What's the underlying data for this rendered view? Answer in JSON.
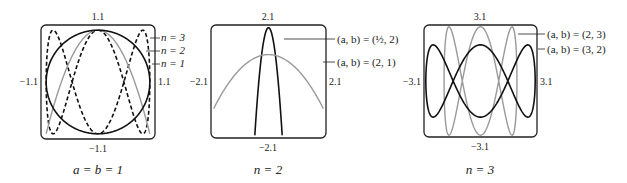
{
  "chart_data": [
    {
      "type": "line",
      "title": "a = b = 1",
      "caption": "a = b = 1",
      "equation": "x = a sin t, y = b cos(n t)",
      "xlim": [
        -1.1,
        1.1
      ],
      "ylim": [
        -1.1,
        1.1
      ],
      "tick_labels": {
        "top": "1.1",
        "bottom": "−1.1",
        "left": "−1.1",
        "right": "1.1"
      },
      "series": [
        {
          "name": "n = 3",
          "a": 1,
          "b": 1,
          "n": 3,
          "style": "dashed",
          "color": "#111111"
        },
        {
          "name": "n = 2",
          "a": 1,
          "b": 1,
          "n": 2,
          "style": "solid",
          "color": "#999999"
        },
        {
          "name": "n = 1",
          "a": 1,
          "b": 1,
          "n": 1,
          "style": "solid",
          "color": "#111111"
        }
      ],
      "legend": [
        "n = 3",
        "n = 2",
        "n = 1"
      ]
    },
    {
      "type": "line",
      "title": "n = 2",
      "caption": "n = 2",
      "xlim": [
        -2.1,
        2.1
      ],
      "ylim": [
        -2.1,
        2.1
      ],
      "tick_labels": {
        "top": "2.1",
        "bottom": "−2.1",
        "left": "−2.1",
        "right": "2.1"
      },
      "series": [
        {
          "name": "(a, b) = (1/2, 2)",
          "a": 0.5,
          "b": 2,
          "n": 2,
          "style": "solid",
          "color": "#111111"
        },
        {
          "name": "(a, b) = (2, 1)",
          "a": 2,
          "b": 1,
          "n": 2,
          "style": "solid",
          "color": "#999999"
        }
      ],
      "legend": [
        "(a, b) = (1/2, 2)",
        "(a, b) = (2, 1)"
      ]
    },
    {
      "type": "line",
      "title": "n = 3",
      "caption": "n = 3",
      "xlim": [
        -3.1,
        3.1
      ],
      "ylim": [
        -3.1,
        3.1
      ],
      "tick_labels": {
        "top": "3.1",
        "bottom": "−3.1",
        "left": "−3.1",
        "right": "3.1"
      },
      "series": [
        {
          "name": "(a, b) = (2, 3)",
          "a": 2,
          "b": 3,
          "n": 3,
          "style": "solid",
          "color": "#999999"
        },
        {
          "name": "(a, b) = (3, 2)",
          "a": 3,
          "b": 2,
          "n": 3,
          "style": "solid",
          "color": "#111111"
        }
      ],
      "legend": [
        "(a, b) = (2, 3)",
        "(a, b) = (3, 2)"
      ]
    }
  ],
  "panels": [
    {
      "caption": "a = b = 1",
      "top": "1.1",
      "bottom": "−1.1",
      "left": "−1.1",
      "right": "1.1",
      "labels": [
        "n = 3",
        "n = 2",
        "n = 1"
      ]
    },
    {
      "caption": "n = 2",
      "top": "2.1",
      "bottom": "−2.1",
      "left": "−2.1",
      "right": "2.1",
      "labels": [
        "(a, b) = (½, 2)",
        "(a, b) = (2, 1)"
      ]
    },
    {
      "caption": "n = 3",
      "top": "3.1",
      "bottom": "−3.1",
      "left": "−3.1",
      "right": "3.1",
      "labels": [
        "(a, b) = (2, 3)",
        "(a, b) = (3, 2)"
      ]
    }
  ]
}
